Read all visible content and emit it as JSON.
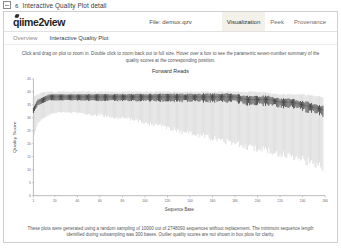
{
  "figure": {
    "icon": "image-placeholder-icon",
    "number": "6",
    "title": "Interactive Quality Plot detail"
  },
  "header": {
    "brand_main": "q",
    "brand_mid": "me2",
    "brand_suffix": "view",
    "brand_full": "qiime2view",
    "file_label": "File: demux.qzv",
    "tabs": [
      {
        "label": "Visualization",
        "active": true
      },
      {
        "label": "Peek",
        "active": false
      },
      {
        "label": "Provenance",
        "active": false
      }
    ]
  },
  "subnav": {
    "items": [
      {
        "label": "Overview",
        "current": false
      },
      {
        "label": "Interactive Quality Plot",
        "current": true
      }
    ]
  },
  "main": {
    "instructions": "Click and drag on plot to zoom in. Double click to zoom back out to full size. Hover over a box to see the parametric seven-number summary of the quality scores at the corresponding position.",
    "footnote": "These plots were generated using a random sampling of 10000 out of 2748090 sequences without replacement. The minimum sequence length identified during subsampling was 300 bases. Outlier quality scores are not shown in box plots for clarity."
  },
  "chart_data": {
    "type": "line",
    "title": "Forward Reads",
    "xlabel": "Sequence Base",
    "ylabel": "Quality Score",
    "xlim": [
      1,
      260
    ],
    "ylim": [
      0,
      45
    ],
    "grid": false,
    "legend": "none",
    "xticks": [
      1,
      20,
      40,
      60,
      80,
      100,
      120,
      140,
      160,
      180,
      200,
      220,
      240,
      260
    ],
    "yticks": [
      0,
      5,
      10,
      15,
      20,
      25,
      30,
      35,
      40,
      45
    ],
    "series": [
      {
        "name": "Median quality score",
        "x": [
          1,
          5,
          10,
          15,
          20,
          30,
          40,
          50,
          60,
          70,
          80,
          90,
          100,
          110,
          120,
          130,
          140,
          150,
          160,
          170,
          180,
          190,
          200,
          210,
          220,
          230,
          240,
          250,
          258
        ],
        "values": [
          33,
          36,
          37,
          38,
          38,
          38,
          38,
          38,
          38,
          38,
          38,
          38,
          38,
          38,
          38,
          38,
          38,
          38,
          38,
          38,
          38,
          37,
          37,
          37,
          36,
          36,
          35,
          34,
          33
        ]
      },
      {
        "name": "Lower whisker (2nd percentile)",
        "x": [
          1,
          5,
          10,
          15,
          20,
          30,
          40,
          50,
          60,
          70,
          80,
          90,
          100,
          110,
          120,
          130,
          140,
          150,
          160,
          170,
          180,
          190,
          200,
          210,
          220,
          230,
          240,
          250,
          258
        ],
        "values": [
          22,
          28,
          30,
          31,
          32,
          32,
          32,
          31,
          31,
          30,
          30,
          29,
          28,
          27,
          26,
          25,
          24,
          23,
          22,
          21,
          20,
          19,
          18,
          17,
          16,
          15,
          14,
          12,
          11
        ]
      },
      {
        "name": "Upper whisker (98th percentile)",
        "x": [
          1,
          5,
          10,
          15,
          20,
          30,
          40,
          50,
          60,
          70,
          80,
          90,
          100,
          120,
          140,
          160,
          180,
          200,
          220,
          240,
          258
        ],
        "values": [
          38,
          39,
          40,
          40,
          40,
          40,
          40,
          40,
          40,
          40,
          40,
          40,
          40,
          40,
          40,
          40,
          40,
          40,
          39,
          39,
          38
        ]
      }
    ]
  }
}
